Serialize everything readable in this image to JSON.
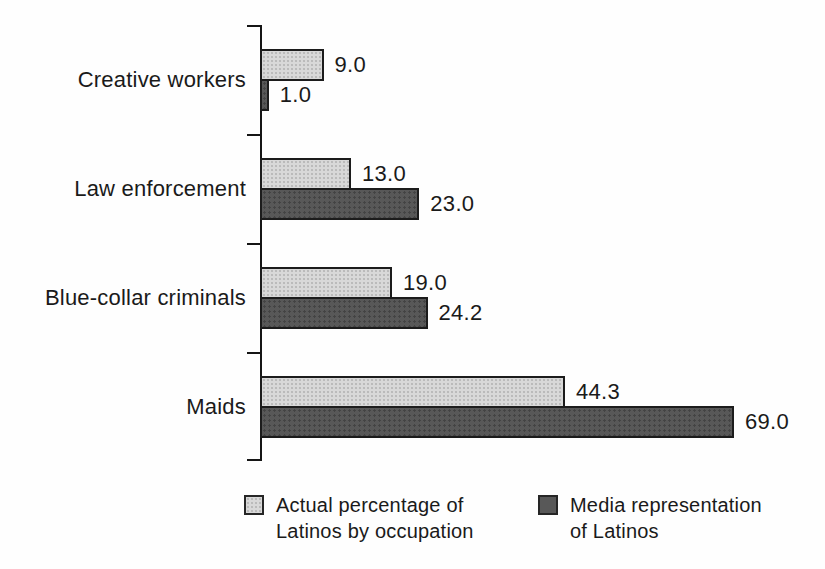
{
  "chart_data": {
    "type": "bar",
    "orientation": "horizontal",
    "title": "",
    "xlabel": "",
    "ylabel": "",
    "categories": [
      "Creative workers",
      "Law enforcement",
      "Blue-collar criminals",
      "Maids"
    ],
    "series": [
      {
        "name": "Actual percentage of Latinos by occupation",
        "color": "#d8d8d8",
        "values": [
          9.0,
          13.0,
          19.0,
          44.3
        ]
      },
      {
        "name": "Media representation of Latinos",
        "color": "#585858",
        "values": [
          1.0,
          23.0,
          24.2,
          69.0
        ]
      }
    ],
    "value_labels": [
      "9.0",
      "1.0",
      "13.0",
      "23.0",
      "19.0",
      "24.2",
      "44.3",
      "69.0"
    ],
    "xlim": [
      0,
      69
    ],
    "grid": false,
    "legend_position": "bottom",
    "axis_color": "#151515",
    "outline_color": "#1c1c1c"
  },
  "legend": {
    "items": [
      {
        "lines": [
          "Actual percentage of",
          "Latinos by occupation"
        ],
        "series": "actual"
      },
      {
        "lines": [
          "Media representation",
          "of Latinos"
        ],
        "series": "media"
      }
    ]
  }
}
